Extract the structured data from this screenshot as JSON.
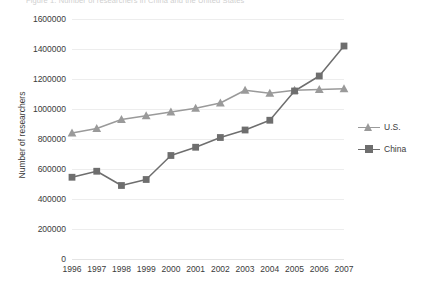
{
  "chart_data": {
    "type": "line",
    "title": "Figure 1. Number of researchers in China and the United States",
    "xlabel": "",
    "ylabel": "Number of researchers",
    "categories": [
      "1996",
      "1997",
      "1998",
      "1999",
      "2000",
      "2001",
      "2002",
      "2003",
      "2004",
      "2005",
      "2006",
      "2007"
    ],
    "ylim": [
      0,
      1600000
    ],
    "ytick_labels": [
      "1600000",
      "1400000",
      "1200000",
      "1000000",
      "800000",
      "600000",
      "400000",
      "200000",
      "0"
    ],
    "ytick_values": [
      1600000,
      1400000,
      1200000,
      1000000,
      800000,
      600000,
      400000,
      200000,
      0
    ],
    "grid": true,
    "legend_position": "right",
    "series": [
      {
        "name": "U.S.",
        "marker": "triangle",
        "color": "#9a9a9a",
        "values": [
          840000,
          870000,
          930000,
          955000,
          980000,
          1005000,
          1040000,
          1125000,
          1105000,
          1125000,
          1130000,
          1135000
        ]
      },
      {
        "name": "China",
        "marker": "square",
        "color": "#6e6e6e",
        "values": [
          545000,
          585000,
          490000,
          530000,
          690000,
          745000,
          810000,
          860000,
          925000,
          1120000,
          1220000,
          1420000
        ]
      }
    ]
  },
  "legend": {
    "items": [
      {
        "label": "U.S."
      },
      {
        "label": "China"
      }
    ]
  },
  "colors": {
    "us": "#9a9a9a",
    "china": "#6e6e6e",
    "grid": "#ededed",
    "text": "#3b3b3b",
    "background": "#ffffff"
  }
}
